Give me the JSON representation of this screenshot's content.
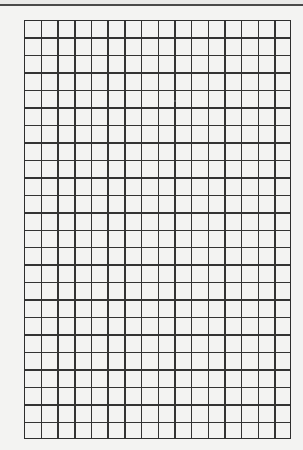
{
  "grid_paper": {
    "columns": 16,
    "rows": 24,
    "line_color": "#333333",
    "background_color": "#f3f3f2"
  }
}
